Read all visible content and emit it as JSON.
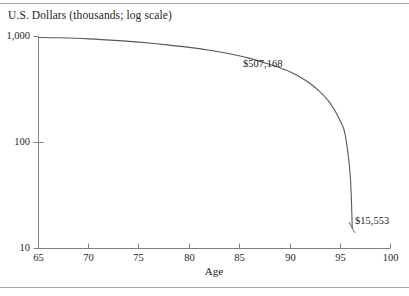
{
  "figure": {
    "y_axis_title": "U.S. Dollars (thousands; log scale)",
    "x_axis_title": "Age"
  },
  "annotations": {
    "upper_label": "$507,168",
    "lower_label": "$15,553"
  },
  "axis_labels": {
    "y": [
      "1,000",
      "100",
      "10"
    ],
    "x": [
      "65",
      "70",
      "75",
      "80",
      "85",
      "90",
      "95",
      "100"
    ]
  },
  "colors": {
    "line": "#58585a",
    "axis": "#808080",
    "rule": "#a8a8a8",
    "text": "#231f20"
  },
  "chart_data": {
    "type": "line",
    "title": "",
    "xlabel": "Age",
    "ylabel": "U.S. Dollars (thousands; log scale)",
    "y_scale": "log",
    "xlim": [
      65,
      100
    ],
    "ylim": [
      10,
      1000
    ],
    "grid": false,
    "legend": null,
    "x_ticks": [
      65,
      70,
      75,
      80,
      85,
      90,
      95,
      100
    ],
    "y_ticks": [
      10,
      100,
      1000
    ],
    "series": [
      {
        "name": "Projected wealth",
        "x": [
          65,
          67,
          70,
          73,
          75,
          78,
          80,
          82,
          84,
          86,
          88,
          89,
          90,
          91,
          92,
          93,
          94,
          95,
          95.5,
          96,
          96.2
        ],
        "values": [
          980,
          972,
          950,
          915,
          885,
          830,
          790,
          742,
          688,
          622,
          545,
          507,
          465,
          415,
          360,
          300,
          235,
          160,
          118,
          48,
          15.553
        ]
      }
    ],
    "point_annotations": [
      {
        "label": "$507,168",
        "age": 89,
        "value_thousands": 507.168
      },
      {
        "label": "$15,553",
        "age": 96.2,
        "value_thousands": 15.553
      }
    ]
  }
}
